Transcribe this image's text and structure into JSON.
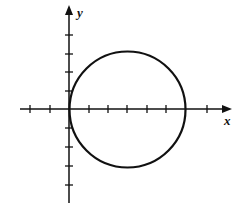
{
  "diagram": {
    "type": "circle on coordinate axes",
    "x_axis_label": "x",
    "y_axis_label": "y",
    "origin_px": [
      69,
      109
    ],
    "tick_spacing_px": 19.5,
    "x_ticks": [
      -2,
      -1,
      1,
      2,
      3,
      4,
      5,
      6,
      7
    ],
    "y_ticks": [
      4,
      3,
      2,
      1,
      -1,
      -2,
      -3,
      -4
    ],
    "circle": {
      "center": [
        3,
        0
      ],
      "radius": 3
    },
    "colors": {
      "stroke": "#111111",
      "background": "#ffffff"
    }
  }
}
